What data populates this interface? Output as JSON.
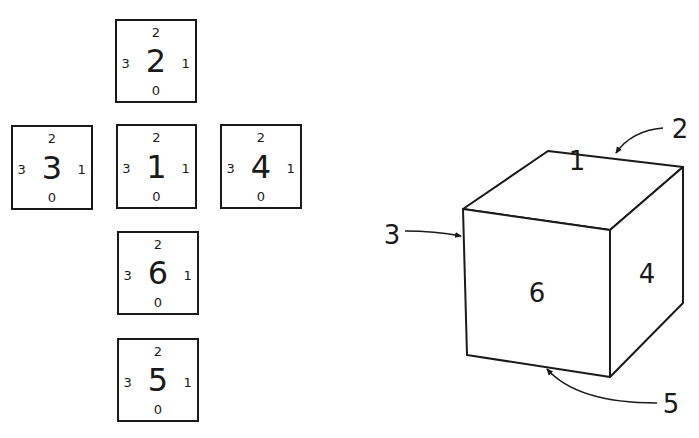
{
  "net": {
    "faces": [
      {
        "id": "2",
        "top": "2",
        "left": "3",
        "right": "1",
        "bottom": "0",
        "box": {
          "x": 115,
          "y": 19,
          "w": 82,
          "h": 84
        }
      },
      {
        "id": "3",
        "top": "2",
        "left": "3",
        "right": "1",
        "bottom": "0",
        "box": {
          "x": 11,
          "y": 125,
          "w": 82,
          "h": 85
        }
      },
      {
        "id": "1",
        "top": "2",
        "left": "3",
        "right": "1",
        "bottom": "0",
        "box": {
          "x": 116,
          "y": 124,
          "w": 81,
          "h": 85
        }
      },
      {
        "id": "4",
        "top": "2",
        "left": "3",
        "right": "1",
        "bottom": "0",
        "box": {
          "x": 220,
          "y": 124,
          "w": 82,
          "h": 85
        }
      },
      {
        "id": "6",
        "top": "2",
        "left": "3",
        "right": "1",
        "bottom": "0",
        "box": {
          "x": 117,
          "y": 231,
          "w": 82,
          "h": 84
        }
      },
      {
        "id": "5",
        "top": "2",
        "left": "3",
        "right": "1",
        "bottom": "0",
        "box": {
          "x": 117,
          "y": 338,
          "w": 82,
          "h": 84
        }
      }
    ]
  },
  "cube": {
    "visible_faces": {
      "top": "1",
      "front": "6",
      "right": "4"
    },
    "callouts": {
      "back": "2",
      "left": "3",
      "bottom": "5"
    }
  },
  "colors": {
    "ink": "#1a1a1a",
    "background": "#ffffff"
  }
}
